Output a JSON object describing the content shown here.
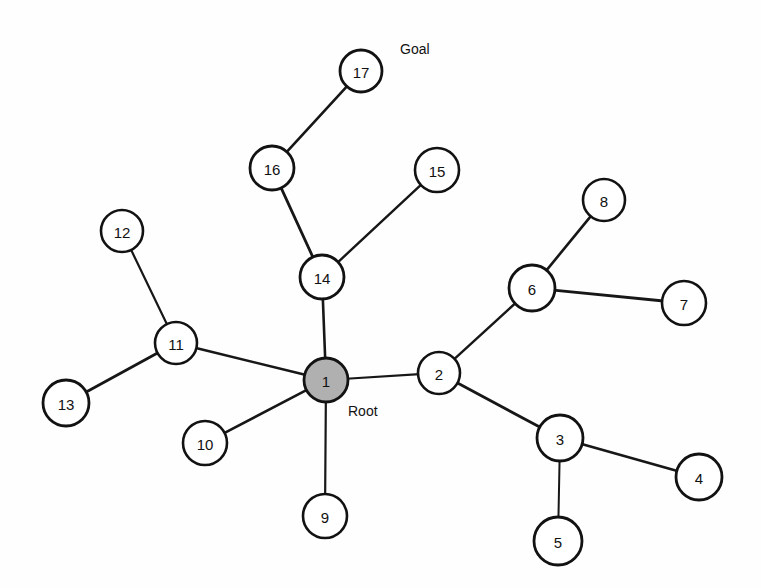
{
  "diagram": {
    "width": 761,
    "height": 588,
    "background_color": "#fefefe",
    "edge_color": "#171717",
    "node_stroke_color": "#121212",
    "node_fill_default": "#ffffff",
    "node_fill_highlight": "#b0b0b0",
    "label_text_color": "#111111"
  },
  "chart_data": {
    "type": "diagram",
    "nodes": [
      {
        "id": "1",
        "label": "1",
        "x": 326,
        "y": 380,
        "r": 22,
        "fill": "#b0b0b0",
        "stroke_width": 2.8,
        "role": "root"
      },
      {
        "id": "2",
        "label": "2",
        "x": 439,
        "y": 373,
        "r": 21,
        "fill": "#ffffff",
        "stroke_width": 2.6,
        "role": "node"
      },
      {
        "id": "3",
        "label": "3",
        "x": 560,
        "y": 438,
        "r": 23,
        "fill": "#ffffff",
        "stroke_width": 2.8,
        "role": "node"
      },
      {
        "id": "4",
        "label": "4",
        "x": 699,
        "y": 477,
        "r": 23,
        "fill": "#ffffff",
        "stroke_width": 2.8,
        "role": "node"
      },
      {
        "id": "5",
        "label": "5",
        "x": 558,
        "y": 541,
        "r": 24,
        "fill": "#ffffff",
        "stroke_width": 2.8,
        "role": "node"
      },
      {
        "id": "6",
        "label": "6",
        "x": 532,
        "y": 288,
        "r": 23,
        "fill": "#ffffff",
        "stroke_width": 2.8,
        "role": "node"
      },
      {
        "id": "7",
        "label": "7",
        "x": 684,
        "y": 303,
        "r": 22,
        "fill": "#ffffff",
        "stroke_width": 2.6,
        "role": "node"
      },
      {
        "id": "8",
        "label": "8",
        "x": 604,
        "y": 200,
        "r": 21,
        "fill": "#ffffff",
        "stroke_width": 2.6,
        "role": "node"
      },
      {
        "id": "9",
        "label": "9",
        "x": 325,
        "y": 516,
        "r": 22,
        "fill": "#ffffff",
        "stroke_width": 2.6,
        "role": "node"
      },
      {
        "id": "10",
        "label": "10",
        "x": 205,
        "y": 443,
        "r": 22,
        "fill": "#ffffff",
        "stroke_width": 2.6,
        "role": "node"
      },
      {
        "id": "11",
        "label": "11",
        "x": 176,
        "y": 343,
        "r": 21,
        "fill": "#ffffff",
        "stroke_width": 2.6,
        "role": "node"
      },
      {
        "id": "12",
        "label": "12",
        "x": 122,
        "y": 231,
        "r": 21,
        "fill": "#ffffff",
        "stroke_width": 2.6,
        "role": "node"
      },
      {
        "id": "13",
        "label": "13",
        "x": 66,
        "y": 403,
        "r": 23,
        "fill": "#ffffff",
        "stroke_width": 2.8,
        "role": "node"
      },
      {
        "id": "14",
        "label": "14",
        "x": 322,
        "y": 277,
        "r": 22,
        "fill": "#ffffff",
        "stroke_width": 2.8,
        "role": "node"
      },
      {
        "id": "15",
        "label": "15",
        "x": 437,
        "y": 170,
        "r": 22,
        "fill": "#ffffff",
        "stroke_width": 2.6,
        "role": "node"
      },
      {
        "id": "16",
        "label": "16",
        "x": 272,
        "y": 168,
        "r": 22,
        "fill": "#ffffff",
        "stroke_width": 2.8,
        "role": "node"
      },
      {
        "id": "17",
        "label": "17",
        "x": 361,
        "y": 71,
        "r": 21,
        "fill": "#ffffff",
        "stroke_width": 2.8,
        "role": "goal"
      }
    ],
    "edges": [
      {
        "from": "1",
        "to": "14",
        "width": 2.6
      },
      {
        "from": "1",
        "to": "11",
        "width": 2.6
      },
      {
        "from": "1",
        "to": "10",
        "width": 2.6
      },
      {
        "from": "1",
        "to": "9",
        "width": 2.2
      },
      {
        "from": "1",
        "to": "2",
        "width": 2.2
      },
      {
        "from": "2",
        "to": "6",
        "width": 2.4
      },
      {
        "from": "2",
        "to": "3",
        "width": 2.8
      },
      {
        "from": "3",
        "to": "4",
        "width": 2.6
      },
      {
        "from": "3",
        "to": "5",
        "width": 2.0
      },
      {
        "from": "6",
        "to": "8",
        "width": 2.6
      },
      {
        "from": "6",
        "to": "7",
        "width": 2.8
      },
      {
        "from": "11",
        "to": "12",
        "width": 2.2
      },
      {
        "from": "11",
        "to": "13",
        "width": 2.8
      },
      {
        "from": "14",
        "to": "16",
        "width": 2.8
      },
      {
        "from": "14",
        "to": "15",
        "width": 2.4
      },
      {
        "from": "16",
        "to": "17",
        "width": 2.6
      }
    ],
    "annotations": [
      {
        "id": "goal-annotation",
        "text": "Goal",
        "x": 400,
        "y": 49,
        "node": "17"
      },
      {
        "id": "root-annotation",
        "text": "Root",
        "x": 348,
        "y": 411,
        "node": "1"
      }
    ]
  }
}
